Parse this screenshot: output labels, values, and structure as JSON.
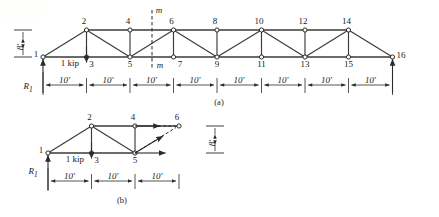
{
  "figure": {
    "title_caption_a": "(a)",
    "title_caption_b": "(b)"
  },
  "panel_a": {
    "name": "full-truss",
    "height_dim": "8'",
    "reaction_label": "R",
    "reaction_sub": "1",
    "load_label": "1 kip",
    "section_label_top": "m",
    "section_label_bottom": "m",
    "top_nodes": [
      "2",
      "4",
      "6",
      "8",
      "10",
      "12",
      "14"
    ],
    "bottom_nodes": [
      "1",
      "3",
      "5",
      "7",
      "9",
      "11",
      "13",
      "15",
      "16"
    ],
    "panel_dims": [
      "10'",
      "10'",
      "10'",
      "10'",
      "10'",
      "10'",
      "10'",
      "10'"
    ],
    "caption": "(a)"
  },
  "panel_b": {
    "name": "free-body-diagram",
    "height_dim": "8'",
    "reaction_label": "R",
    "reaction_sub": "1",
    "load_label": "1 kip",
    "top_nodes": [
      "2",
      "4",
      "6"
    ],
    "bottom_nodes": [
      "1",
      "3",
      "5"
    ],
    "panel_dims": [
      "10'",
      "10'",
      "10'"
    ],
    "caption": "(b)"
  },
  "colors": {
    "line": "#3a3a3a",
    "text": "#1a1a1a",
    "background": "#ffffff"
  }
}
